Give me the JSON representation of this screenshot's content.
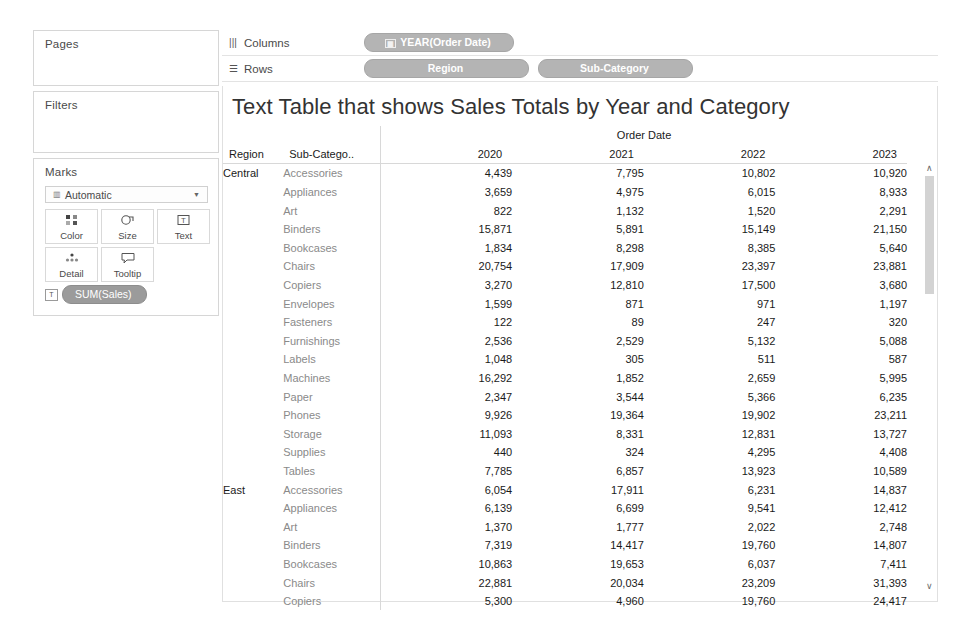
{
  "left_panel": {
    "pages": {
      "title": "Pages"
    },
    "filters": {
      "title": "Filters"
    },
    "marks": {
      "title": "Marks",
      "mark_type": "Automatic",
      "buttons": [
        {
          "label": "Color",
          "icon": "color-squares-icon"
        },
        {
          "label": "Size",
          "icon": "size-icon"
        },
        {
          "label": "Text",
          "icon": "text-icon"
        },
        {
          "label": "Detail",
          "icon": "detail-icon"
        },
        {
          "label": "Tooltip",
          "icon": "tooltip-icon"
        }
      ],
      "pills": [
        {
          "label": "SUM(Sales)",
          "icon": "text-mark-icon"
        }
      ]
    }
  },
  "shelves": {
    "columns": {
      "label": "Columns",
      "icon": "columns-icon",
      "pills": [
        "YEAR(Order Date)"
      ]
    },
    "rows": {
      "label": "Rows",
      "icon": "rows-icon",
      "pills": [
        "Region",
        "Sub-Category"
      ]
    }
  },
  "view": {
    "title": "Text Table that shows Sales Totals by Year and Category",
    "scrollbar": {
      "up": "∧",
      "down": "∨"
    }
  },
  "chart_data": {
    "type": "table",
    "title": "Text Table that shows Sales Totals by Year and Category",
    "column_group_header": "Order Date",
    "row_headers": [
      "Region",
      "Sub-Catego.."
    ],
    "categories": [
      "2020",
      "2021",
      "2022",
      "2023"
    ],
    "xlabel": "Order Date",
    "ylabel": "",
    "measure": "SUM(Sales)",
    "groups": [
      {
        "region": "Central",
        "rows": [
          {
            "sub_category": "Accessories",
            "values": [
              "4,439",
              "7,795",
              "10,802",
              "10,920"
            ]
          },
          {
            "sub_category": "Appliances",
            "values": [
              "3,659",
              "4,975",
              "6,015",
              "8,933"
            ]
          },
          {
            "sub_category": "Art",
            "values": [
              "822",
              "1,132",
              "1,520",
              "2,291"
            ]
          },
          {
            "sub_category": "Binders",
            "values": [
              "15,871",
              "5,891",
              "15,149",
              "21,150"
            ]
          },
          {
            "sub_category": "Bookcases",
            "values": [
              "1,834",
              "8,298",
              "8,385",
              "5,640"
            ]
          },
          {
            "sub_category": "Chairs",
            "values": [
              "20,754",
              "17,909",
              "23,397",
              "23,881"
            ]
          },
          {
            "sub_category": "Copiers",
            "values": [
              "3,270",
              "12,810",
              "17,500",
              "3,680"
            ]
          },
          {
            "sub_category": "Envelopes",
            "values": [
              "1,599",
              "871",
              "971",
              "1,197"
            ]
          },
          {
            "sub_category": "Fasteners",
            "values": [
              "122",
              "89",
              "247",
              "320"
            ]
          },
          {
            "sub_category": "Furnishings",
            "values": [
              "2,536",
              "2,529",
              "5,132",
              "5,088"
            ]
          },
          {
            "sub_category": "Labels",
            "values": [
              "1,048",
              "305",
              "511",
              "587"
            ]
          },
          {
            "sub_category": "Machines",
            "values": [
              "16,292",
              "1,852",
              "2,659",
              "5,995"
            ]
          },
          {
            "sub_category": "Paper",
            "values": [
              "2,347",
              "3,544",
              "5,366",
              "6,235"
            ]
          },
          {
            "sub_category": "Phones",
            "values": [
              "9,926",
              "19,364",
              "19,902",
              "23,211"
            ]
          },
          {
            "sub_category": "Storage",
            "values": [
              "11,093",
              "8,331",
              "12,831",
              "13,727"
            ]
          },
          {
            "sub_category": "Supplies",
            "values": [
              "440",
              "324",
              "4,295",
              "4,408"
            ]
          },
          {
            "sub_category": "Tables",
            "values": [
              "7,785",
              "6,857",
              "13,923",
              "10,589"
            ]
          }
        ]
      },
      {
        "region": "East",
        "rows": [
          {
            "sub_category": "Accessories",
            "values": [
              "6,054",
              "17,911",
              "6,231",
              "14,837"
            ]
          },
          {
            "sub_category": "Appliances",
            "values": [
              "6,139",
              "6,699",
              "9,541",
              "12,412"
            ]
          },
          {
            "sub_category": "Art",
            "values": [
              "1,370",
              "1,777",
              "2,022",
              "2,748"
            ]
          },
          {
            "sub_category": "Binders",
            "values": [
              "7,319",
              "14,417",
              "19,760",
              "14,807"
            ]
          },
          {
            "sub_category": "Bookcases",
            "values": [
              "10,863",
              "19,653",
              "6,037",
              "7,411"
            ]
          },
          {
            "sub_category": "Chairs",
            "values": [
              "22,881",
              "20,034",
              "23,209",
              "31,393"
            ]
          },
          {
            "sub_category": "Copiers",
            "values": [
              "5,300",
              "4,960",
              "19,760",
              "24,417"
            ]
          }
        ]
      }
    ]
  }
}
